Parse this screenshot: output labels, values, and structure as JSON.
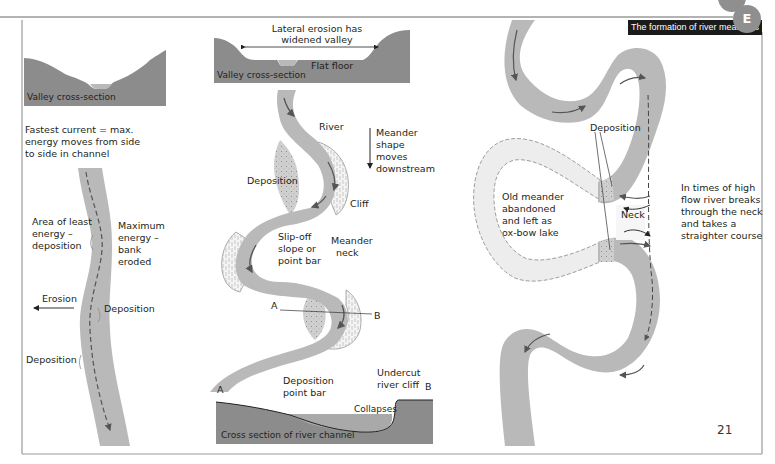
{
  "header": {
    "title": "The formation of river meanders",
    "section_badge": "E",
    "page_number": "21"
  },
  "panel_left": {
    "valley_label": "Valley cross-section",
    "intro_text": [
      "Fastest current = max.",
      "energy moves from side",
      "to side in channel"
    ],
    "least_energy": [
      "Area of least",
      "energy –",
      "deposition"
    ],
    "max_energy": [
      "Maximum",
      "energy –",
      "bank",
      "eroded"
    ],
    "erosion": "Erosion",
    "deposition_right": "Deposition",
    "deposition_left": "Deposition"
  },
  "panel_middle": {
    "lateral_erosion": [
      "Lateral erosion has",
      "widened valley"
    ],
    "flat_floor": "Flat floor",
    "valley_label": "Valley cross-section",
    "river": "River",
    "meander_moves": [
      "Meander",
      "shape",
      "moves",
      "downstream"
    ],
    "deposition": "Deposition",
    "cliff": "Cliff",
    "slip_off": [
      "Slip-off",
      "slope or",
      "point bar"
    ],
    "meander_neck": [
      "Meander",
      "neck"
    ],
    "point_a": "A",
    "point_b": "B",
    "xsec_a": "A",
    "xsec_b": "B",
    "deposition_point_bar": [
      "Deposition",
      "point bar"
    ],
    "undercut": [
      "Undercut",
      "river cliff"
    ],
    "collapses": "Collapses",
    "cross_section_label": "Cross section of river channel"
  },
  "panel_right": {
    "deposition": "Deposition",
    "old_meander": [
      "Old meander",
      "abandoned",
      "and left as",
      "ox-bow lake"
    ],
    "neck": "Neck",
    "high_flow": [
      "In times of high",
      "flow river breaks",
      "through the neck",
      "and takes a",
      "straighter course"
    ]
  },
  "colors": {
    "river": "#b9b9b9",
    "ground": "#8c8c8c",
    "ground_light": "#a6a6a6",
    "oxbow": "#ededed",
    "arrow": "#555555",
    "title_bg": "#1b1b1b",
    "badge": "#8f8f8f",
    "frame": "#9a9a9a"
  }
}
